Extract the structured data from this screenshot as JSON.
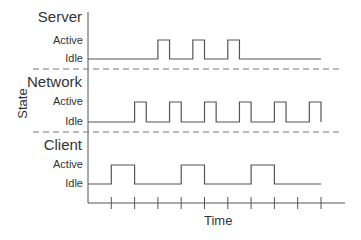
{
  "diagram": {
    "type": "timing-diagram",
    "y_axis_label": "State",
    "x_axis_label": "Time",
    "state_labels": {
      "active": "Active",
      "idle": "Idle"
    },
    "x_ticks": 10,
    "line_color": "#555555",
    "divider_color": "#777777",
    "rows": [
      {
        "name": "Server",
        "active_intervals": [
          [
            6,
            7
          ],
          [
            9,
            10
          ],
          [
            12,
            13
          ]
        ]
      },
      {
        "name": "Network",
        "active_intervals": [
          [
            2,
            2.5
          ],
          [
            3.5,
            4
          ],
          [
            5,
            5.5
          ],
          [
            6.5,
            7
          ],
          [
            8,
            8.5
          ],
          [
            9.5,
            10
          ]
        ]
      },
      {
        "name": "Client",
        "active_intervals": [
          [
            1,
            2
          ],
          [
            4,
            5
          ],
          [
            7,
            8
          ]
        ]
      }
    ]
  }
}
